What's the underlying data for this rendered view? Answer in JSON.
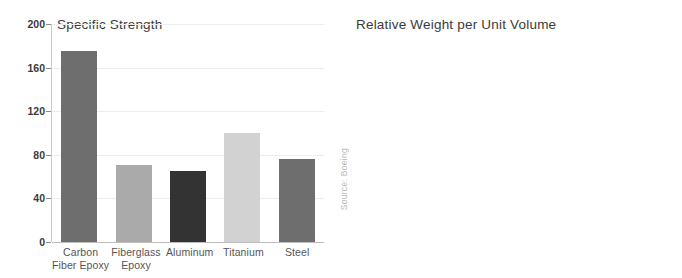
{
  "figure": {
    "source_note": "Source: Boeing",
    "background": "#ffffff"
  },
  "series_colors": {
    "Carbon Fiber Epoxy": "#6e6e6e",
    "Fiberglass Epoxy": "#aaaaaa",
    "Aluminum": "#333333",
    "Titanium": "#d2d2d2",
    "Steel": "#6e6e6e"
  },
  "chart_data": [
    {
      "type": "bar",
      "title": "Specific Strength",
      "xlabel": "",
      "ylabel": "",
      "categories": [
        "Carbon Fiber Epoxy",
        "Fiberglass Epoxy",
        "Aluminum",
        "Titanium",
        "Steel"
      ],
      "category_lines": [
        [
          "Carbon",
          "Fiber Epoxy"
        ],
        [
          "Fiberglass",
          "Epoxy"
        ],
        [
          "Aluminum"
        ],
        [
          "Titanium"
        ],
        [
          "Steel"
        ]
      ],
      "values": [
        175,
        71,
        65,
        100,
        76
      ],
      "colors": [
        "#6e6e6e",
        "#aaaaaa",
        "#333333",
        "#d2d2d2",
        "#6e6e6e"
      ],
      "ylim": [
        0,
        200
      ],
      "yticks": [
        0,
        40,
        80,
        120,
        160,
        200
      ],
      "ytick_labels": [
        "0",
        "40",
        "80",
        "120",
        "160",
        "200"
      ],
      "axis_position": "left",
      "grid": true,
      "legend": "none"
    },
    {
      "type": "bar",
      "title": "Relative Weight per Unit Volume",
      "xlabel": "",
      "ylabel": "",
      "categories": [
        "Carbon Fiber Epoxy",
        "Fiberglass Epoxy",
        "Aluminum",
        "Titanium",
        "Steel"
      ],
      "category_lines": [
        [
          "Carbon",
          "Fiber Epoxy"
        ],
        [
          "Fiberglass",
          "Epoxy"
        ],
        [
          "Aluminum"
        ],
        [
          "Titanium"
        ],
        [
          "Steel"
        ]
      ],
      "values": [
        1.15,
        1.35,
        1.87,
        2.98,
        5.33
      ],
      "colors": [
        "#6e6e6e",
        "#aaaaaa",
        "#333333",
        "#d2d2d2",
        "#6e6e6e"
      ],
      "ylim": [
        0,
        6
      ],
      "yticks": [
        0,
        1,
        2,
        3,
        4,
        5,
        6
      ],
      "ytick_labels": [
        "0",
        "1",
        "2",
        "3",
        "4",
        "5",
        "6"
      ],
      "axis_position": "right",
      "grid": true,
      "legend": "none"
    }
  ]
}
